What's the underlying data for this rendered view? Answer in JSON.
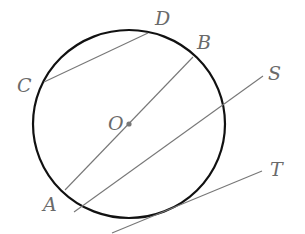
{
  "diagram": {
    "type": "geometry-circle-lines",
    "colors": {
      "circle": "#111111",
      "line": "#777777",
      "label": "#6a6a6a",
      "center_dot": "#777777"
    },
    "circle": {
      "cx": 129,
      "cy": 124,
      "rx": 96,
      "ry": 94
    },
    "center": {
      "label": "O",
      "x": 129,
      "y": 124,
      "label_x": 108,
      "label_y": 130
    },
    "lines": [
      {
        "name": "chord-cd",
        "x1": 44,
        "y1": 82,
        "x2": 148,
        "y2": 33
      },
      {
        "name": "diameter-ab",
        "x1": 65,
        "y1": 190,
        "x2": 193,
        "y2": 57
      },
      {
        "name": "secant-s",
        "x1": 74,
        "y1": 212,
        "x2": 263,
        "y2": 76
      },
      {
        "name": "tangent-t",
        "x1": 112,
        "y1": 233,
        "x2": 262,
        "y2": 171
      }
    ],
    "labels": [
      {
        "name": "label-c",
        "text": "C",
        "x": 17,
        "y": 92
      },
      {
        "name": "label-d",
        "text": "D",
        "x": 155,
        "y": 25
      },
      {
        "name": "label-b",
        "text": "B",
        "x": 197,
        "y": 49
      },
      {
        "name": "label-s",
        "text": "S",
        "x": 268,
        "y": 80
      },
      {
        "name": "label-t",
        "text": "T",
        "x": 270,
        "y": 176
      },
      {
        "name": "label-a",
        "text": "A",
        "x": 43,
        "y": 211
      }
    ]
  }
}
